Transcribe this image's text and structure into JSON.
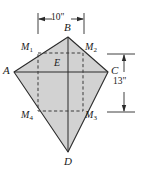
{
  "figure": {
    "fill_color": "#d2d2d2",
    "stroke_color": "#2b2b2b",
    "dash_color": "#3a3a3a",
    "background_color": "#ffffff",
    "vertices": [
      {
        "name": "A",
        "label": "A",
        "x": 14,
        "y": 72
      },
      {
        "name": "B",
        "label": "B",
        "x": 68,
        "y": 37
      },
      {
        "name": "C",
        "label": "C",
        "x": 108,
        "y": 72
      },
      {
        "name": "D",
        "label": "D",
        "x": 68,
        "y": 152
      }
    ],
    "center_point": {
      "name": "E",
      "label": "E"
    },
    "midpoints": [
      {
        "name": "M1",
        "label": "M",
        "sub": "1"
      },
      {
        "name": "M2",
        "label": "M",
        "sub": "2"
      },
      {
        "name": "M3",
        "label": "M",
        "sub": "3"
      },
      {
        "name": "M4",
        "label": "M",
        "sub": "4"
      }
    ],
    "dimensions": [
      {
        "name": "width",
        "label": "10\"",
        "orientation": "horizontal",
        "position": "top"
      },
      {
        "name": "height",
        "label": "13\"",
        "orientation": "vertical",
        "position": "right"
      }
    ]
  }
}
